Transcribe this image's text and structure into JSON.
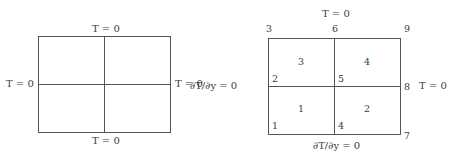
{
  "left_diagram": {
    "boundary_labels": {
      "top": "T = 0",
      "bottom": "T = 0",
      "left": "T = 0",
      "right": "T = 0"
    }
  },
  "right_diagram": {
    "boundary_labels": {
      "top": "T = 0",
      "bottom": "∂T/∂y = 0",
      "left": "∂T/∂y = 0",
      "right": "T = 0"
    },
    "nodes": [
      "1",
      "2",
      "3",
      "4",
      "5",
      "6",
      "7",
      "8",
      "9"
    ],
    "elements": [
      "1",
      "2",
      "3",
      "4"
    ]
  },
  "colors": {
    "line": "#555555",
    "text": "#3a3a3a"
  }
}
